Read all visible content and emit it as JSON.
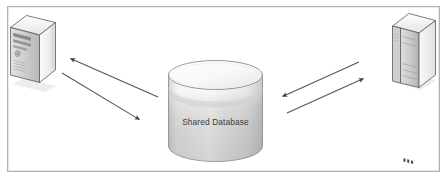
{
  "diagram": {
    "type": "architecture-diagram",
    "canvas": {
      "width": 447,
      "height": 185,
      "background": "#ffffff"
    },
    "frame": {
      "name": "diagram-border",
      "x": 7,
      "y": 6,
      "width": 433,
      "height": 166,
      "stroke": "#b3b3b3",
      "fill": "#ffffff"
    },
    "nodes": [
      {
        "id": "left-application",
        "kind": "desktop-computer",
        "label": "",
        "position": {
          "x": 8,
          "y": 14,
          "width": 48,
          "height": 76
        },
        "fill_light": "#f2f2f2",
        "fill_mid": "#d9d9d9",
        "fill_dark": "#a8a8a8",
        "stroke": "#4a4a4a"
      },
      {
        "id": "shared-database",
        "kind": "cylinder-database",
        "label": "Shared Database",
        "position": {
          "x": 168,
          "y": 61,
          "width": 94,
          "height": 101
        },
        "fill_light": "#fbfbfb",
        "fill_mid": "#d2d2d2",
        "fill_dark": "#bcbcbc",
        "stroke": "#8d8d8d"
      },
      {
        "id": "right-server",
        "kind": "server-tower",
        "label": "",
        "position": {
          "x": 392,
          "y": 13,
          "width": 44,
          "height": 76
        },
        "fill_light": "#f0f0f0",
        "fill_mid": "#d4d4d4",
        "fill_dark": "#a5a5a5",
        "stroke": "#4a4a4a"
      }
    ],
    "connectors": [
      {
        "id": "db-to-left-app",
        "direction": "to-left-application",
        "from": {
          "x": 158,
          "y": 97
        },
        "to": {
          "x": 69,
          "y": 58
        },
        "arrowhead": "end",
        "stroke": "#555555"
      },
      {
        "id": "left-app-to-db",
        "direction": "to-shared-database",
        "from": {
          "x": 62,
          "y": 73
        },
        "to": {
          "x": 141,
          "y": 120
        },
        "arrowhead": "end",
        "stroke": "#555555"
      },
      {
        "id": "right-server-to-db",
        "direction": "to-shared-database",
        "from": {
          "x": 359,
          "y": 62
        },
        "to": {
          "x": 281,
          "y": 97
        },
        "arrowhead": "end",
        "stroke": "#555555"
      },
      {
        "id": "db-to-right-server",
        "direction": "to-right-server",
        "from": {
          "x": 287,
          "y": 113
        },
        "to": {
          "x": 365,
          "y": 78
        },
        "arrowhead": "end",
        "stroke": "#555555"
      }
    ],
    "colors": {
      "border": "#b3b3b3",
      "arrow": "#555555",
      "label_text": "#3a3a3a",
      "background": "#ffffff"
    }
  }
}
